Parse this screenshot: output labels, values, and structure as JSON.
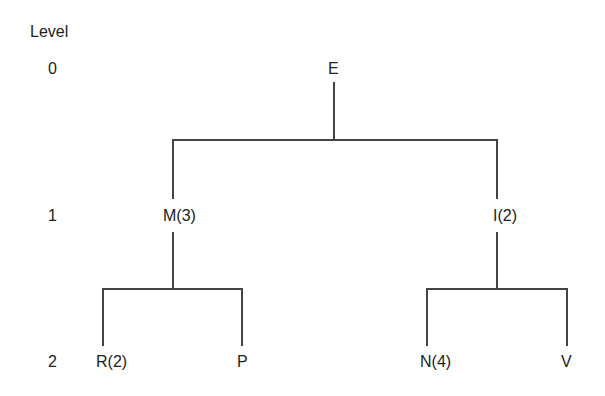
{
  "diagram": {
    "type": "tree",
    "level_header": "Level",
    "levels": [
      "0",
      "1",
      "2"
    ],
    "nodes": {
      "root": "E",
      "left": "M(3)",
      "right": "I(2)",
      "left_left": "R(2)",
      "left_right": "P",
      "right_left": "N(4)",
      "right_right": "V"
    },
    "edges": [
      [
        "E",
        "M(3)"
      ],
      [
        "E",
        "I(2)"
      ],
      [
        "M(3)",
        "R(2)"
      ],
      [
        "M(3)",
        "P"
      ],
      [
        "I(2)",
        "N(4)"
      ],
      [
        "I(2)",
        "V"
      ]
    ],
    "line_color": "#444444"
  }
}
